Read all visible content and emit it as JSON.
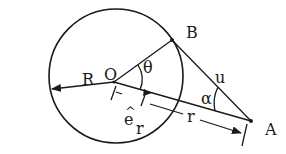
{
  "diagram": {
    "title": "",
    "colors": {
      "ink": "#1a1a1a",
      "background": "#ffffff"
    },
    "labels": {
      "R": "R",
      "O": "O",
      "theta": "θ",
      "B": "B",
      "u": "u",
      "alpha": "α",
      "e_r_hat": "^",
      "e_r_e": "e",
      "e_r_sub": "r",
      "r": "r",
      "A": "A"
    },
    "elements": {
      "circle": {
        "cx": 116,
        "cy": 76,
        "radius": 67
      },
      "points": {
        "O": [
          114,
          82
        ],
        "B": [
          172,
          40
        ],
        "A": [
          251,
          121
        ]
      }
    }
  }
}
